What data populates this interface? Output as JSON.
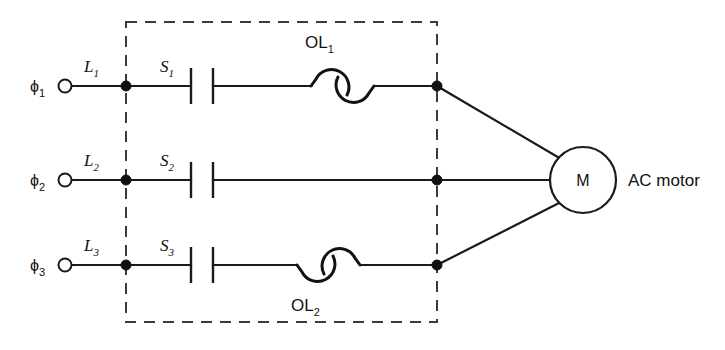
{
  "diagram": {
    "enclosure": {
      "name": "starter-enclosure",
      "style": "dashed"
    },
    "phases": [
      {
        "terminal_label": "ϕ",
        "terminal_sub": "1",
        "line_label": "L",
        "line_sub": "1",
        "switch_label": "S",
        "switch_sub": "1",
        "overload_label": "OL",
        "overload_sub": "1",
        "overload_present": true,
        "overload_label_position": "above"
      },
      {
        "terminal_label": "ϕ",
        "terminal_sub": "2",
        "line_label": "L",
        "line_sub": "2",
        "switch_label": "S",
        "switch_sub": "2",
        "overload_label": "",
        "overload_sub": "",
        "overload_present": false,
        "overload_label_position": ""
      },
      {
        "terminal_label": "ϕ",
        "terminal_sub": "3",
        "line_label": "L",
        "line_sub": "3",
        "switch_label": "S",
        "switch_sub": "3",
        "overload_label": "OL",
        "overload_sub": "2",
        "overload_present": true,
        "overload_label_position": "below"
      }
    ],
    "motor": {
      "symbol_letter": "M",
      "caption": "AC motor"
    },
    "colors": {
      "wire": "#1a1a1a",
      "enclosure": "#3b3b3b",
      "background": "#ffffff",
      "text": "#111111"
    }
  }
}
